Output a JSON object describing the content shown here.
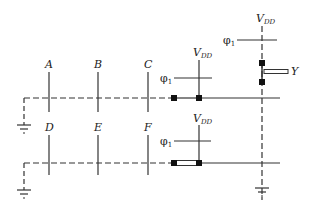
{
  "diagram": {
    "type": "NMOS dynamic logic circuit layout (stick diagram)",
    "inputs_top": [
      "A",
      "B",
      "C"
    ],
    "inputs_bottom": [
      "D",
      "E",
      "F"
    ],
    "clock_label": "φ",
    "clock_sub": "1",
    "supply_label": "V",
    "supply_sub": "DD",
    "output_label": "Y",
    "colors": {
      "line": "#333333",
      "contact": "#111111",
      "background": "#ffffff"
    }
  }
}
